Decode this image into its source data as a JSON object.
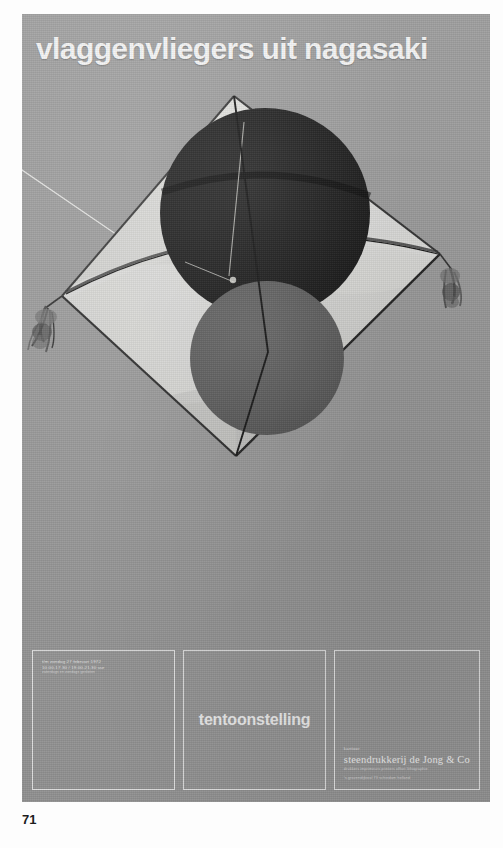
{
  "page": {
    "folio": "71",
    "background": "#ffffff"
  },
  "poster": {
    "background_color": "#9a9a9a",
    "title": "vlaggenvliegers uit nagasaki",
    "title_color": "#f4f4f4"
  },
  "kite": {
    "description": "diamond kite with two circular roundels",
    "sail_color": "#d8d8d6",
    "top_circle_color": "#151515",
    "bottom_circle_color": "#595959",
    "spar_color": "#111111",
    "line_color": "#e8e8e8",
    "tassel_left": "tassel-left",
    "tassel_right": "tassel-right"
  },
  "panels": {
    "dates": {
      "lines": [
        "t/m zondag 27 februari 1972",
        "10.00-17.30 / 19.00-21.30 uur",
        "zaterdags en zondags gesloten"
      ]
    },
    "exhibition": {
      "word": "tentoonstelling"
    },
    "printer": {
      "label": "kantoor",
      "name": "steendrukkerij de Jong & Co",
      "lines": [
        "drukkers imprimeurs printers offset lithographie",
        "'s-gravendijkwal 73 schiedam holland"
      ]
    }
  }
}
